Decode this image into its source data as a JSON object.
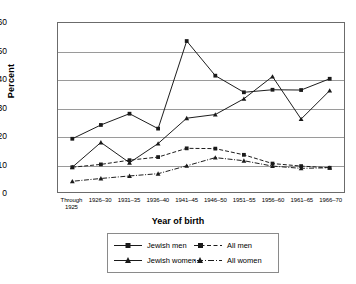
{
  "chart_data": {
    "type": "line",
    "title": "",
    "xlabel": "Year of birth",
    "ylabel": "Percent",
    "ylim": [
      0,
      60
    ],
    "yticks": [
      0,
      10,
      20,
      30,
      40,
      50,
      60
    ],
    "grid": true,
    "legend_position": "bottom",
    "categories": [
      "Through 1925",
      "1926–30",
      "1931–35",
      "1936–40",
      "1941–45",
      "1946–50",
      "1951–55",
      "1956–60",
      "1961–65",
      "1966–70"
    ],
    "series": [
      {
        "name": "Jewish men",
        "marker": "square",
        "line": "solid",
        "values": [
          18.9,
          23.8,
          27.8,
          22.5,
          53.6,
          41.3,
          35.4,
          36.3,
          36.2,
          40.2
        ]
      },
      {
        "name": "Jewish women",
        "marker": "triangle",
        "line": "solid",
        "values": [
          8.8,
          17.6,
          10.4,
          17.2,
          26.2,
          27.5,
          33.1,
          41.0,
          25.9,
          36.0
        ]
      },
      {
        "name": "All men",
        "marker": "square",
        "line": "dashed",
        "values": [
          8.8,
          9.8,
          11.3,
          12.4,
          15.5,
          15.4,
          13.2,
          10.1,
          9.2,
          8.6
        ]
      },
      {
        "name": "All women",
        "marker": "triangle",
        "line": "dashdot",
        "values": [
          3.8,
          4.8,
          5.7,
          6.5,
          9.3,
          12.2,
          11.1,
          9.2,
          8.4,
          8.6
        ]
      }
    ]
  },
  "legend": {
    "items": [
      {
        "label": "Jewish men"
      },
      {
        "label": "All men"
      },
      {
        "label": "Jewish women"
      },
      {
        "label": "All women"
      }
    ]
  },
  "colors": {
    "line": "#1a1a1a",
    "grid": "#9a9a9a",
    "frame": "#6b6b6b"
  }
}
